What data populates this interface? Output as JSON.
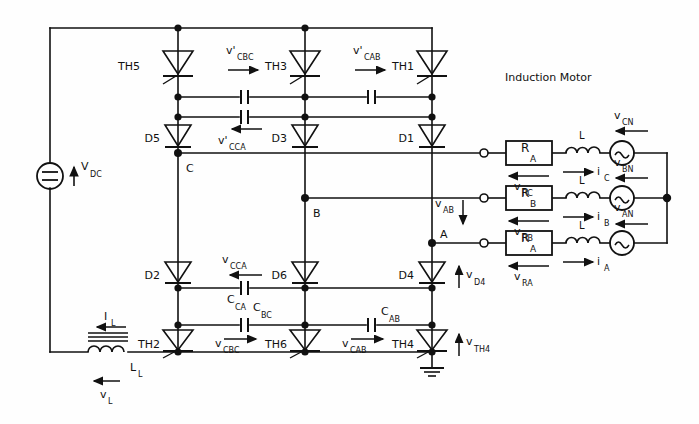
{
  "diagram": {
    "annotation_motor": "Induction Motor",
    "source": {
      "dc_label_main": "V",
      "dc_label_sub": "DC",
      "symbol": "dc-source-circle-equals"
    },
    "dc_link_inductor": {
      "current_main": "I",
      "current_sub": "L",
      "name_main": "L",
      "name_sub": "L",
      "voltage_main": "v",
      "voltage_sub": "L"
    },
    "thyristors": [
      {
        "id": "TH5",
        "column": "C",
        "position": "upper"
      },
      {
        "id": "TH3",
        "column": "B",
        "position": "upper"
      },
      {
        "id": "TH1",
        "column": "A",
        "position": "upper"
      },
      {
        "id": "TH2",
        "column": "C",
        "position": "lower"
      },
      {
        "id": "TH6",
        "column": "B",
        "position": "lower"
      },
      {
        "id": "TH4",
        "column": "A",
        "position": "lower"
      }
    ],
    "diodes": [
      {
        "id": "D5",
        "column": "C",
        "position": "upper"
      },
      {
        "id": "D3",
        "column": "B",
        "position": "upper"
      },
      {
        "id": "D1",
        "column": "A",
        "position": "upper"
      },
      {
        "id": "D2",
        "column": "C",
        "position": "lower"
      },
      {
        "id": "D6",
        "column": "B",
        "position": "lower"
      },
      {
        "id": "D4",
        "column": "A",
        "position": "lower"
      }
    ],
    "capacitors": [
      {
        "id_main": "C",
        "id_sub": "CA",
        "row": "lower-upper"
      },
      {
        "id_main": "C",
        "id_sub": "BC",
        "row": "lower-lower"
      },
      {
        "id_main": "C",
        "id_sub": "AB",
        "row": "lower-lower"
      }
    ],
    "cap_voltages_upper": [
      {
        "main": "v'",
        "sub": "CBC",
        "arrow": "right"
      },
      {
        "main": "v'",
        "sub": "CAB",
        "arrow": "right"
      },
      {
        "main": "v'",
        "sub": "CCA",
        "arrow": "left"
      }
    ],
    "cap_voltages_lower": [
      {
        "main": "v",
        "sub": "CCA",
        "arrow": "left"
      },
      {
        "main": "v",
        "sub": "CBC",
        "arrow": "right"
      },
      {
        "main": "v",
        "sub": "CAB",
        "arrow": "right"
      }
    ],
    "nodes": [
      {
        "label": "C"
      },
      {
        "label": "B"
      },
      {
        "label": "A"
      }
    ],
    "device_voltages": [
      {
        "main": "v",
        "sub": "D4",
        "arrow": "up"
      },
      {
        "main": "v",
        "sub": "TH4",
        "arrow": "up"
      }
    ],
    "line_voltage": {
      "main": "v",
      "sub": "AB",
      "arrow": "down"
    },
    "motor": {
      "resistors": [
        {
          "main": "R",
          "sub": "A",
          "v_main": "v",
          "v_sub": "RC",
          "phase": "C"
        },
        {
          "main": "R",
          "sub": "B",
          "v_main": "v",
          "v_sub": "RB",
          "phase": "B"
        },
        {
          "main": "R",
          "sub": "A",
          "v_main": "v",
          "v_sub": "RA",
          "phase": "A"
        }
      ],
      "inductors": [
        {
          "name": "L",
          "current_main": "i",
          "current_sub": "C"
        },
        {
          "name": "L",
          "current_main": "i",
          "current_sub": "B"
        },
        {
          "name": "L",
          "current_main": "i",
          "current_sub": "A"
        }
      ],
      "emf_sources": [
        {
          "main": "v",
          "sub": "CN",
          "arrow": "left"
        },
        {
          "main": "v",
          "sub": "BN",
          "arrow": "left"
        },
        {
          "main": "v",
          "sub": "AN",
          "arrow": "left"
        }
      ]
    },
    "ground": {
      "name": "earth-ground-symbol"
    },
    "colors": {
      "ink": "#111111",
      "paper": "#fefefe"
    }
  }
}
